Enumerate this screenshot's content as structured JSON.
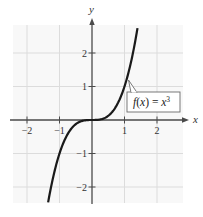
{
  "chart_data": {
    "type": "line",
    "title": "",
    "xlabel": "x",
    "ylabel": "y",
    "xlim": [
      -2.4,
      2.8
    ],
    "ylim": [
      -2.5,
      2.8
    ],
    "grid": true,
    "x_ticks": [
      -2,
      -1,
      1,
      2
    ],
    "y_ticks": [
      -2,
      -1,
      1,
      2
    ],
    "x_tick_labels": [
      "−2",
      "−1",
      "1",
      "2"
    ],
    "y_tick_labels": [
      "−2",
      "−1",
      "1",
      "2"
    ],
    "series": [
      {
        "name": "f(x) = x^3",
        "function": "x^3",
        "x": [
          -1.35,
          -1.2,
          -1.0,
          -0.8,
          -0.6,
          -0.4,
          -0.2,
          0,
          0.2,
          0.4,
          0.6,
          0.8,
          1.0,
          1.2,
          1.4
        ],
        "y": [
          -2.46,
          -1.728,
          -1.0,
          -0.512,
          -0.216,
          -0.064,
          -0.008,
          0,
          0.008,
          0.064,
          0.216,
          0.512,
          1.0,
          1.728,
          2.744
        ]
      }
    ],
    "annotations": [
      {
        "text_prefix": "f(x) = x",
        "superscript": "3",
        "points_to": [
          1.05,
          1.16
        ]
      }
    ]
  },
  "labels": {
    "x_axis": "x",
    "y_axis": "y",
    "fn_prefix_f": "f",
    "fn_prefix_paren_open": "(",
    "fn_prefix_x": "x",
    "fn_prefix_paren_close": ")",
    "fn_equals": " = ",
    "fn_rhs_var": "x",
    "fn_exponent": "3",
    "x_ticks": [
      "−2",
      "−1",
      "1",
      "2"
    ],
    "y_ticks": [
      "2",
      "1",
      "−1",
      "−2"
    ]
  },
  "colors": {
    "grid": "#d9d9d9",
    "grid_bg": "#f7f7f7",
    "axis": "#444444",
    "curve": "#1a1a1a",
    "label_box_border": "#666666"
  }
}
